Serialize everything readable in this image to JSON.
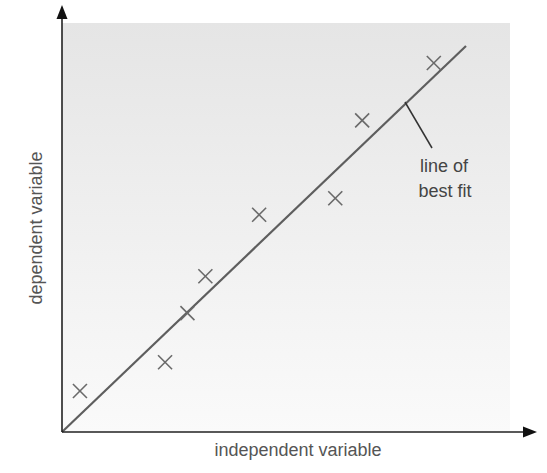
{
  "chart_data": {
    "type": "scatter",
    "title": "",
    "xlabel": "independent variable",
    "ylabel": "dependent variable",
    "ticks": {
      "x": [],
      "y": []
    },
    "grid": false,
    "legend": null,
    "xlim": [
      0,
      100
    ],
    "ylim": [
      0,
      100
    ],
    "series": [
      {
        "name": "data points",
        "marker": "x",
        "points": [
          {
            "x": 4,
            "y": 10
          },
          {
            "x": 23,
            "y": 17
          },
          {
            "x": 28,
            "y": 29
          },
          {
            "x": 32,
            "y": 38
          },
          {
            "x": 44,
            "y": 53
          },
          {
            "x": 61,
            "y": 57
          },
          {
            "x": 67,
            "y": 76
          },
          {
            "x": 83,
            "y": 90
          }
        ]
      }
    ],
    "fit_line": {
      "name": "line of best fit",
      "from": {
        "x": 0,
        "y": 0
      },
      "to": {
        "x": 90,
        "y": 94
      }
    },
    "annotations": [
      {
        "text_line1": "line of",
        "text_line2": "best fit",
        "points_to": "fit_line"
      }
    ]
  },
  "labels": {
    "x_axis": "independent variable",
    "y_axis": "dependent variable",
    "annotation_line1": "line of",
    "annotation_line2": "best fit"
  },
  "colors": {
    "panel_top": "#e6e6e6",
    "panel_bottom": "#f9f9f9",
    "axis": "#222222",
    "fit_line": "#5a5a5a",
    "marker": "#6a6a6a",
    "text": "#555555"
  }
}
